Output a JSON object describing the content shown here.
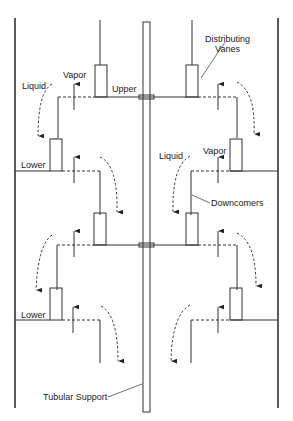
{
  "diagram": {
    "type": "tray column cross-section",
    "labels": {
      "distributing_vanes": [
        "Distributing",
        "Vanes"
      ],
      "vapor_1": "Vapor",
      "liquid_1": "Liquid",
      "upper_1": "Upper",
      "lower_1": "Lower",
      "liquid_2": "Liquid",
      "vapor_2": "Vapor",
      "downcomers": "Downcomers",
      "lower_2": "Lower",
      "tubular_support": "Tubular Support"
    },
    "colors": {
      "line": "#333333",
      "background": "#ffffff"
    }
  }
}
